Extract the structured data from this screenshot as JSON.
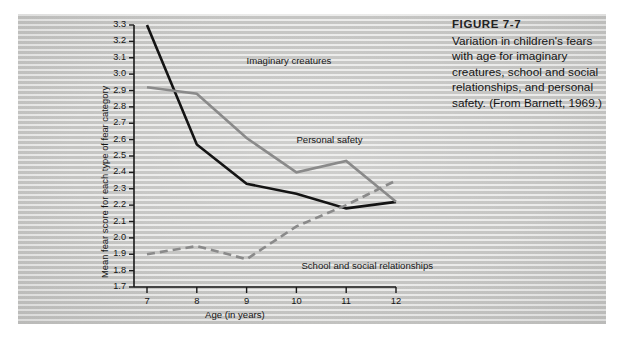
{
  "figure": {
    "caption_title": "FIGURE 7-7",
    "caption_text": "Variation in children's fears with age for imaginary creatures, school and social relationships, and personal safety. (From Barnett, 1969.)"
  },
  "chart_data": {
    "type": "line",
    "title": "",
    "xlabel": "Age (in years)",
    "ylabel": "Mean fear score for each type of fear category",
    "x": [
      7,
      8,
      9,
      10,
      11,
      12
    ],
    "xtick_labels": [
      "7",
      "8",
      "9",
      "10",
      "11",
      "12"
    ],
    "xlim": [
      6.6,
      12.3
    ],
    "ylim": [
      1.7,
      3.3
    ],
    "ytick_labels": [
      "3.3",
      "3.2",
      "3.1",
      "3.0",
      "2.9",
      "2.8",
      "2.7",
      "2.6",
      "2.5",
      "2.4",
      "2.3",
      "2.2",
      "2.1",
      "2.0",
      "1.9",
      "1.8",
      "1.7"
    ],
    "ytick_values": [
      3.3,
      3.2,
      3.1,
      3.0,
      2.9,
      2.8,
      2.7,
      2.6,
      2.5,
      2.4,
      2.3,
      2.2,
      2.1,
      2.0,
      1.9,
      1.8,
      1.7
    ],
    "grid": false,
    "legend_position": "inline-annotations",
    "series": [
      {
        "name": "Imaginary creatures",
        "color": "#141414",
        "style": "solid",
        "width": 2.6,
        "values": [
          3.3,
          2.57,
          2.33,
          2.27,
          2.18,
          2.22
        ],
        "label_x": 9.0,
        "label_y": 3.08
      },
      {
        "name": "Personal safety",
        "color": "#8a8a8a",
        "style": "solid",
        "width": 2.6,
        "values": [
          2.92,
          2.88,
          2.61,
          2.4,
          2.47,
          2.22
        ],
        "label_x": 10.0,
        "label_y": 2.6
      },
      {
        "name": "School and social relationships",
        "color": "#8a8a8a",
        "style": "dashed",
        "width": 2.6,
        "values": [
          1.9,
          1.95,
          1.87,
          2.07,
          2.2,
          2.35
        ],
        "label_x": 10.1,
        "label_y": 1.83
      }
    ]
  }
}
